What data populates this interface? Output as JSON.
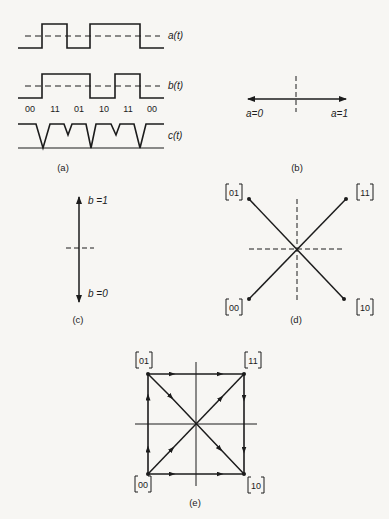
{
  "panels": {
    "a": {
      "caption": "(a)",
      "signals": {
        "a": "a(t)",
        "b": "b(t)",
        "c": "c(t)"
      },
      "bit_pairs": [
        "00",
        "11",
        "01",
        "10",
        "11",
        "00"
      ]
    },
    "b": {
      "caption": "(b)",
      "left_label": "a=0",
      "right_label": "a=1"
    },
    "c": {
      "caption": "(c)",
      "top_label": "b =1",
      "bottom_label": "b =0"
    },
    "d": {
      "caption": "(d)",
      "points": {
        "top_left": "01",
        "top_right": "11",
        "bottom_left": "00",
        "bottom_right": "10"
      }
    },
    "e": {
      "caption": "(e)",
      "points": {
        "top_left": "01",
        "top_right": "11",
        "bottom_left": "00",
        "bottom_right": "10"
      }
    }
  },
  "colors": {
    "ink": "#1c1c1c",
    "paper": "#f7f6f3"
  }
}
